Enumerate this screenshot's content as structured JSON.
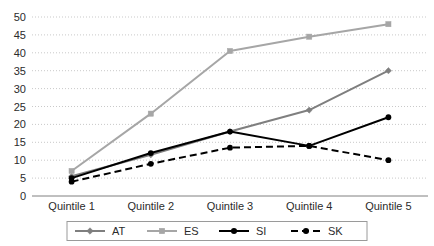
{
  "chart_data": {
    "type": "line",
    "title": "",
    "subtitle": "",
    "xlabel": "",
    "ylabel": "",
    "categories": [
      "Quintile 1",
      "Quintile 2",
      "Quintile 3",
      "Quintile 4",
      "Quintile 5"
    ],
    "ylim": [
      0,
      50
    ],
    "ytick_step": 5,
    "yticks": [
      0,
      5,
      10,
      15,
      20,
      25,
      30,
      35,
      40,
      45,
      50
    ],
    "ytick_labels": [
      "0",
      "5",
      "10",
      "15",
      "20",
      "25",
      "30",
      "35",
      "40",
      "45",
      "50"
    ],
    "grid": true,
    "grid_style": "dotted-horizontal",
    "legend_position": "bottom",
    "series": [
      {
        "name": "AT",
        "values": [
          5.5,
          11.5,
          18,
          24,
          35
        ],
        "color": "#7f7f7f",
        "marker": "diamond",
        "line_style": "solid",
        "line_width": 2
      },
      {
        "name": "ES",
        "values": [
          7,
          23,
          40.5,
          44.5,
          48
        ],
        "color": "#a6a6a6",
        "marker": "square",
        "line_style": "solid",
        "line_width": 2
      },
      {
        "name": "SI",
        "values": [
          5,
          12,
          18,
          14,
          22
        ],
        "color": "#000000",
        "marker": "circle",
        "line_style": "solid",
        "line_width": 2
      },
      {
        "name": "SK",
        "values": [
          4,
          9,
          13.5,
          14,
          10
        ],
        "color": "#000000",
        "marker": "circle",
        "line_style": "dashed",
        "line_width": 2
      }
    ]
  },
  "colors": {
    "background": "#ffffff",
    "axis": "#808080",
    "grid": "#c9c9c9",
    "text": "#2b2b2b",
    "legend_border": "#9a9a9a"
  }
}
